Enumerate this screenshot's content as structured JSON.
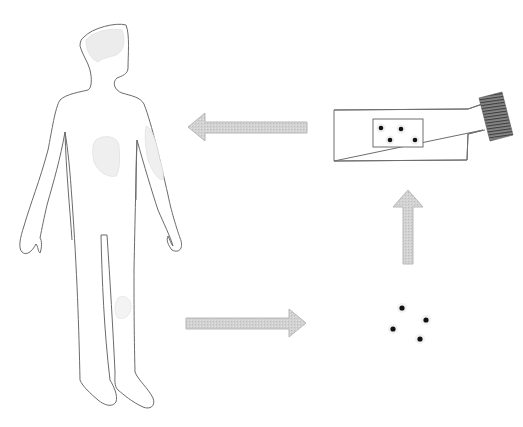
{
  "diagram": {
    "colors": {
      "background": "#ffffff",
      "outline": "#6b6b6b",
      "region_fill": "#ececec",
      "arrow_fill": "#cfcfcf",
      "arrow_stroke": "#b5b5b5",
      "cell_dot": "#111111",
      "connector": "#6e6e6e"
    },
    "nodes": [
      {
        "id": "human-body",
        "label": ""
      },
      {
        "id": "cells",
        "label": "",
        "count": 4
      },
      {
        "id": "test-strip",
        "label": "",
        "wells": 4
      }
    ],
    "arrows": [
      {
        "from": "human-body",
        "to": "cells",
        "direction": "right"
      },
      {
        "from": "cells",
        "to": "test-strip",
        "direction": "up"
      },
      {
        "from": "test-strip",
        "to": "human-body",
        "direction": "left"
      }
    ]
  }
}
